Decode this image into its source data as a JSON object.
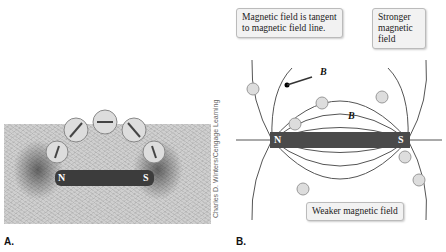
{
  "panel_a": {
    "label": "A.",
    "magnet": {
      "north": "N",
      "south": "S"
    },
    "credit": "Charles D. Winters/Cengage Learning",
    "compass_count": 5
  },
  "panel_b": {
    "label": "B.",
    "magnet": {
      "north": "N",
      "south": "S"
    },
    "field_vector_label": "B",
    "callouts": {
      "tangent": "Magnetic field is tangent to magnetic field line.",
      "stronger": "Stronger magnetic field",
      "weaker": "Weaker magnetic field"
    }
  },
  "colors": {
    "magnet": "#4a4a4a",
    "field_line": "#555555",
    "compass": "#d8d0cc",
    "callout_bg": "#f2f2f2"
  }
}
